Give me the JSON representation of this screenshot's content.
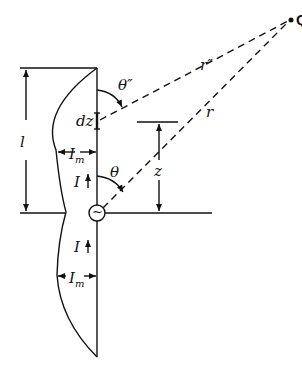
{
  "diagram": {
    "labels": {
      "Q": "Q",
      "r_double_prime": "r″",
      "r": "r",
      "theta_double_prime": "θ″",
      "theta": "θ",
      "dz": "dz",
      "l": "l",
      "z": "z",
      "I_m": "I",
      "I_m_sub": "m",
      "I": "I",
      "I_lower": "I",
      "I_m_lower": "I",
      "I_m_lower_sub": "m",
      "source_symbol": "~"
    },
    "colors": {
      "line": "#111111",
      "background": "#ffffff"
    }
  }
}
